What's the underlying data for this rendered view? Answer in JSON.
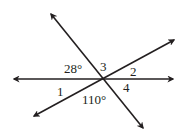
{
  "diagram": {
    "lines": [
      {
        "id": "line-nw-se",
        "arrows": "both"
      },
      {
        "id": "line-horizontal",
        "arrows": "both"
      },
      {
        "id": "line-sw-ne",
        "arrows": "both"
      }
    ],
    "labels": {
      "angle_28": "28°",
      "angle_3": "3",
      "angle_2": "2",
      "angle_1": "1",
      "angle_110": "110°",
      "angle_4": "4"
    },
    "colors": {
      "stroke": "#231f20",
      "background": "#ffffff"
    }
  }
}
